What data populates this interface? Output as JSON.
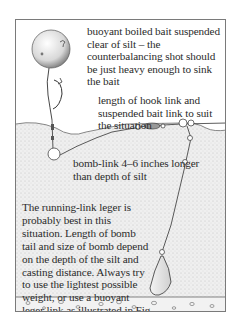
{
  "figure": {
    "labels": {
      "bait": "buoyant boiled bait suspended clear of silt – the counterbalancing shot should be just heavy enough to sink the bait",
      "hook_link": "length of hook link and suspended bait link to suit the situation",
      "bomb_link": "bomb-link 4–6 inches longer than depth of silt",
      "caption": "The running-link leger is probably best in this situation. Length of bomb tail and size of bomb depend on the depth of the silt and casting distance. Always try to use the lightest possible weight, or use a buoyant leger link as illustrated in Fig 69."
    },
    "colors": {
      "ink": "#2b2b2b",
      "frame": "#7a7a7a",
      "silt": "#e4e4e4",
      "background": "#ffffff"
    }
  }
}
